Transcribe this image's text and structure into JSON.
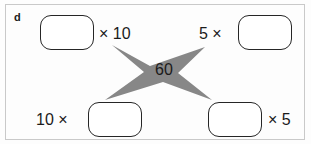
{
  "exercise": {
    "item_letter": "d",
    "product": "60",
    "star_fill": "#878787",
    "box_stroke": "#262626",
    "frame_stroke": "#c9c9c9",
    "text_color": "#1b1b1b",
    "boxes": [
      {
        "id": "top-left",
        "value": "",
        "placeholder": ""
      },
      {
        "id": "top-right",
        "value": "",
        "placeholder": ""
      },
      {
        "id": "bottom-left",
        "value": "",
        "placeholder": ""
      },
      {
        "id": "bottom-right",
        "value": "",
        "placeholder": ""
      }
    ],
    "labels": {
      "top_left": "× 10",
      "top_right": "5 ×",
      "bottom_left": "10 ×",
      "bottom_right": "× 5"
    }
  }
}
